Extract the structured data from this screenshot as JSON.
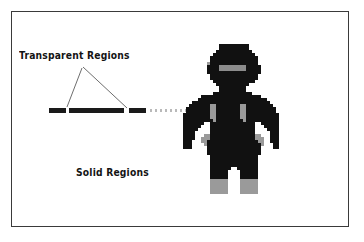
{
  "figure": {
    "background_color": "#ffffff",
    "border_color": "#3a3a3a"
  },
  "labels": {
    "transparent_regions": "Transparent Regions",
    "solid_regions": "Solid Regions"
  },
  "colors": {
    "solid_bar": "#1a1a1a",
    "transparent_dots": "#b9b9b9",
    "leader_line": "#6e6e6e",
    "sprite_dark": "#111111",
    "sprite_grey": "#9a9a9a",
    "sprite_visor": "#8c8c8c",
    "text": "#141414"
  },
  "bar": {
    "y": 108,
    "height": 5,
    "segments": [
      {
        "name": "solid-segment-1",
        "x": 49,
        "width": 17,
        "fill": "solid"
      },
      {
        "name": "solid-segment-2",
        "x": 69,
        "width": 55,
        "fill": "solid"
      },
      {
        "name": "solid-segment-3",
        "x": 129,
        "width": 17,
        "fill": "solid"
      },
      {
        "name": "transparent-run",
        "x": 150,
        "width": 40,
        "fill": "dotted"
      }
    ]
  },
  "leaders": [
    {
      "name": "leader-line-left",
      "x1": 82,
      "y1": 68,
      "x2": 67,
      "y2": 107
    },
    {
      "name": "leader-line-right",
      "x1": 83,
      "y1": 67,
      "x2": 127,
      "y2": 108
    }
  ],
  "sprite": {
    "name": "robot-sprite",
    "pixel_size": 3,
    "columns": 32,
    "rows": 50,
    "legend": {
      "0": "transparent",
      "1": "dark body",
      "2": "grey joint / boot",
      "3": "visor grey"
    },
    "rows_data": [
      "00000000000011111111110000000000",
      "00000000000011111111110000000000",
      "00000000000111111111111000000000",
      "00000000001111111111111100000000",
      "00000000011111111111111110000000",
      "00000000011111111111111110000000",
      "00000000211111111111111110000000",
      "00000000111133333333311111000000",
      "00000000111133333333311111000000",
      "00000000111111111111111111000000",
      "00000000011111111111111110000000",
      "00000000011111111111111110000000",
      "00000000001111111111111100000000",
      "00000000000111111111110000000000",
      "00000000000011111111100000000000",
      "00000000000011111111100000000000",
      "00000000001111111111111000000000",
      "00000011111111111111111111000000",
      "00000111111111111111111111110000",
      "00011111111111111111111111111000",
      "00111111122111111112211111111100",
      "01111111122111111112211111111110",
      "01111111122111111112211111111110",
      "11111111122111111112211111111111",
      "11111111122111111112211111111111",
      "11111111112111111111211111111111",
      "11111110011111111111111100111111",
      "11111100011111111111111100011111",
      "11111000011111111111111100001111",
      "11110000011111111111111100000111",
      "11110002211111111111111122000111",
      "11110022211111111111111122200111",
      "11100022111111111111111112200111",
      "11100002111111111111111111200011",
      "11100000111111111111111111000011",
      "00000000111111111111111111000000",
      "00000000111111111111111111000000",
      "00000000011111111111111110000000",
      "00000000011111111111111110000000",
      "00000000011111111111111110000000",
      "00000000011111111111111110000000",
      "00000000011111110011111110000000",
      "00000000011111100001111110000000",
      "00000000011111100001111110000000",
      "00000000011111100001111110000000",
      "00000000022222200002222220000000",
      "00000000022222200002222220000000",
      "00000000022222200002222220000000",
      "00000000022222200002222220000000",
      "00000000022222200002222220000000"
    ]
  }
}
